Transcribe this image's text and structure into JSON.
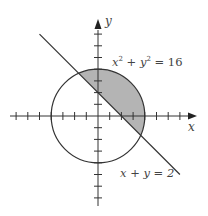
{
  "figure": {
    "title": "",
    "axes": {
      "x_label": "x",
      "y_label": "y",
      "origin_px": [
        98,
        116
      ],
      "unit_px": 11.7,
      "x_ticks": [
        -7,
        -6,
        -5,
        -4,
        -3,
        -2,
        -1,
        1,
        2,
        3,
        4,
        5,
        6,
        7
      ],
      "y_ticks": [
        -7,
        -6,
        -5,
        -4,
        -3,
        -2,
        -1,
        1,
        2,
        3,
        4,
        5,
        6,
        7
      ],
      "x_range": [
        -8,
        8
      ],
      "y_range": [
        -8,
        8
      ]
    },
    "circle": {
      "equation_parts": {
        "x": "x",
        "x_exp": "2",
        "plus": " + ",
        "y": "y",
        "y_exp": "2",
        "eq": " = ",
        "rhs": "16"
      },
      "radius": 4,
      "center": [
        0,
        0
      ]
    },
    "line": {
      "equation": "x + y = 2",
      "from": [
        -5,
        7
      ],
      "to": [
        7,
        -5
      ]
    },
    "shaded_region": {
      "description": "Region inside circle x^2 + y^2 = 16 where x + y >= 2",
      "intersections": [
        [
          -1.646,
          3.646
        ],
        [
          3.646,
          -1.646
        ]
      ],
      "color": "#b4b4b4"
    },
    "colors": {
      "stroke": "#333333",
      "shade": "#b4b4b4",
      "text": "#444444"
    }
  }
}
